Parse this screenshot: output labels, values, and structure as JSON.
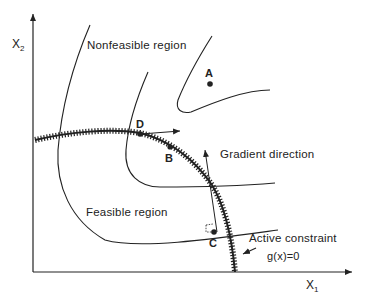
{
  "diagram": {
    "axes": {
      "x_label": "X",
      "x_sub": "1",
      "y_label": "X",
      "y_sub": "2"
    },
    "regions": {
      "nonfeasible": "Nonfeasible region",
      "feasible": "Feasible region"
    },
    "annotations": {
      "gradient": "Gradient direction",
      "active_constraint": "Active constraint",
      "constraint_eq": "g(x)=0"
    },
    "points": {
      "A": "A",
      "B": "B",
      "C": "C",
      "D": "D"
    },
    "colors": {
      "ink": "#222222",
      "background": "#ffffff"
    }
  }
}
